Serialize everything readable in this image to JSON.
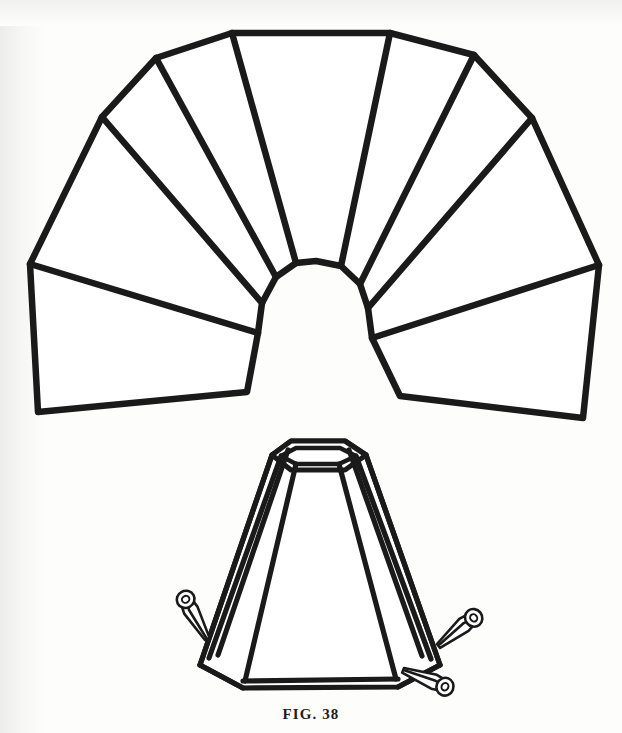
{
  "page": {
    "background_color": "#fdfdfc",
    "ink_color": "#1a1a1a",
    "width": 622,
    "height": 733
  },
  "caption": {
    "text": "FIG. 38",
    "label": "figure-caption"
  },
  "figure": {
    "title": "FIG. 38",
    "stroke_color": "#1a1a1a",
    "fill_color": "#ffffff"
  },
  "diagram_data": {
    "type": "line-drawing",
    "parts": [
      {
        "id": "flat-pattern",
        "name": "flat-fan-pattern",
        "label": "Flat fan-shaped panel layout",
        "panel_count": 7,
        "inner_arc_segments": 7,
        "stroke_width": 6
      },
      {
        "id": "assembled-shade",
        "name": "assembled-shade",
        "label": "Assembled tapered polygonal lampshade",
        "visible_panels": 5,
        "top_ring_sides": 6,
        "bottom_ring_sides": 6,
        "stroke_width": 5
      },
      {
        "id": "clips",
        "name": "spring-clips",
        "label": "Spring clips holding seams",
        "count": 3,
        "positions": [
          "left-lower-seam",
          "right-upper-seam",
          "right-lower-seam"
        ]
      }
    ],
    "flat_pattern": {
      "top_center_panel": {
        "left_x": 232,
        "right_x": 390,
        "top_y": 33
      },
      "left_outer_corner": {
        "x": 30,
        "y": 264
      },
      "left_bottom_corner": {
        "x": 38,
        "y": 412
      },
      "right_outer_corner": {
        "x": 599,
        "y": 265
      },
      "right_bottom_corner": {
        "x": 583,
        "y": 418
      },
      "left_upper_vertex": {
        "x": 102,
        "y": 117
      },
      "right_upper_vertex": {
        "x": 532,
        "y": 118
      },
      "hub_center": {
        "x": 311,
        "y": 330
      },
      "hub_top_y": 262
    },
    "assembled_shade": {
      "top_rim_center": {
        "x": 318,
        "y": 448
      },
      "top_rim_half_width": 42,
      "bottom_left": {
        "x": 243,
        "y": 688
      },
      "bottom_right": {
        "x": 398,
        "y": 685
      },
      "left_shoulder": {
        "x": 200,
        "y": 665
      },
      "right_shoulder": {
        "x": 440,
        "y": 665
      }
    }
  }
}
